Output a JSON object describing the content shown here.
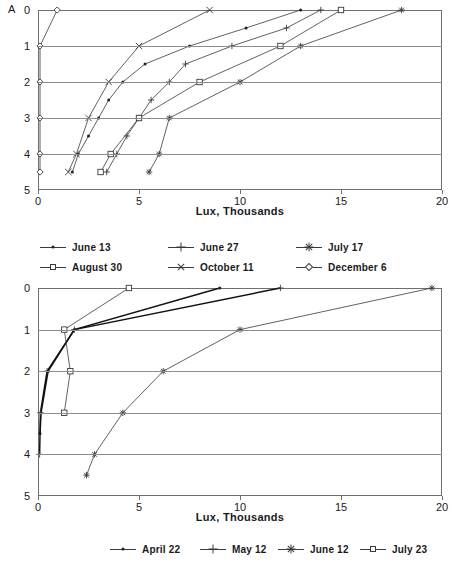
{
  "figure": {
    "panel_a_label": "A",
    "axis_title": "Lux, Thousands"
  },
  "axes": {
    "x_ticks": [
      "0",
      "5",
      "10",
      "15",
      "20"
    ],
    "y_ticks": [
      "0",
      "1",
      "2",
      "3",
      "4",
      "5"
    ],
    "xlim": [
      0,
      20
    ],
    "ylim": [
      0,
      5
    ]
  },
  "legend_a": [
    {
      "label": "June 13",
      "marker": "dot"
    },
    {
      "label": "June 27",
      "marker": "plus"
    },
    {
      "label": "July 17",
      "marker": "star"
    },
    {
      "label": "August 30",
      "marker": "square"
    },
    {
      "label": "October 11",
      "marker": "ex"
    },
    {
      "label": "December 6",
      "marker": "diamond"
    }
  ],
  "legend_b": [
    {
      "label": "April 22",
      "marker": "dot"
    },
    {
      "label": "May 12",
      "marker": "plus"
    },
    {
      "label": "June 12",
      "marker": "star"
    },
    {
      "label": "July 23",
      "marker": "square"
    }
  ],
  "chart_data": [
    {
      "type": "line",
      "panel": "A",
      "title": "A",
      "xlabel": "Lux, Thousands",
      "ylabel": "",
      "xlim": [
        0,
        20
      ],
      "ylim": [
        0,
        5
      ],
      "y_inverted": true,
      "grid": true,
      "x_ticks": [
        0,
        5,
        10,
        15,
        20
      ],
      "y_ticks": [
        0,
        1,
        2,
        3,
        4,
        5
      ],
      "series": [
        {
          "name": "June 13",
          "marker": "dot",
          "depth": [
            0,
            0.5,
            1,
            1.5,
            2,
            2.5,
            3,
            3.5,
            4,
            4.5
          ],
          "lux": [
            13.0,
            10.3,
            7.5,
            5.3,
            4.2,
            3.5,
            3.0,
            2.5,
            2.0,
            1.7
          ]
        },
        {
          "name": "June 27",
          "marker": "plus",
          "depth": [
            0,
            0.5,
            1,
            1.5,
            2,
            2.5,
            3,
            3.5,
            4,
            4.5
          ],
          "lux": [
            14.0,
            12.3,
            9.6,
            7.3,
            6.5,
            5.6,
            5.0,
            4.4,
            3.9,
            3.4
          ]
        },
        {
          "name": "July 17",
          "marker": "star",
          "depth": [
            0,
            1,
            2,
            3,
            4,
            4.5
          ],
          "lux": [
            18.0,
            13.0,
            10.0,
            6.5,
            6.0,
            5.5
          ]
        },
        {
          "name": "August 30",
          "marker": "square",
          "depth": [
            0,
            1,
            2,
            3,
            4,
            4.5
          ],
          "lux": [
            15.0,
            12.0,
            8.0,
            5.0,
            3.6,
            3.1
          ]
        },
        {
          "name": "October 11",
          "marker": "ex",
          "depth": [
            0,
            1,
            2,
            3,
            4,
            4.5
          ],
          "lux": [
            8.5,
            5.0,
            3.5,
            2.5,
            1.9,
            1.5
          ]
        },
        {
          "name": "December 6",
          "marker": "diamond",
          "depth": [
            0,
            1,
            2,
            3,
            4,
            4.5
          ],
          "lux": [
            0.95,
            0.1,
            0.1,
            0.1,
            0.1,
            0.1
          ]
        }
      ]
    },
    {
      "type": "line",
      "panel": "B",
      "title": "",
      "xlabel": "Lux, Thousands",
      "ylabel": "",
      "xlim": [
        0,
        20
      ],
      "ylim": [
        0,
        5
      ],
      "y_inverted": true,
      "grid": true,
      "x_ticks": [
        0,
        5,
        10,
        15,
        20
      ],
      "y_ticks": [
        0,
        1,
        2,
        3,
        4,
        5
      ],
      "series": [
        {
          "name": "April 22",
          "marker": "dot",
          "depth": [
            0,
            1,
            2,
            3,
            3.5
          ],
          "lux": [
            9.0,
            1.8,
            0.5,
            0.15,
            0.1
          ]
        },
        {
          "name": "May 12",
          "marker": "plus",
          "depth": [
            0,
            1,
            2,
            3,
            4
          ],
          "lux": [
            12.0,
            1.8,
            0.45,
            0.12,
            0.08
          ]
        },
        {
          "name": "June 12",
          "marker": "star",
          "depth": [
            0,
            1,
            2,
            3,
            4,
            4.5
          ],
          "lux": [
            19.5,
            10.0,
            6.2,
            4.2,
            2.8,
            2.4
          ]
        },
        {
          "name": "July 23",
          "marker": "square",
          "depth": [
            0,
            1,
            2,
            3
          ],
          "lux": [
            4.5,
            1.3,
            1.6,
            1.3
          ]
        }
      ]
    }
  ]
}
